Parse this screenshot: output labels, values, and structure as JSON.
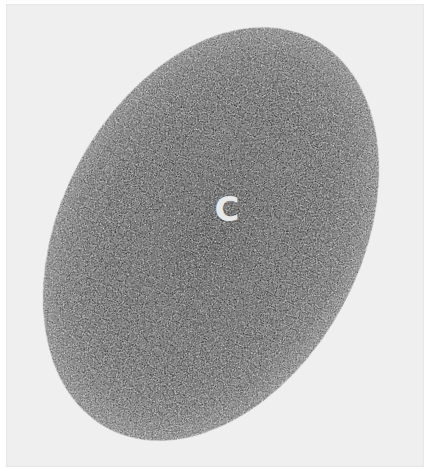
{
  "figure": {
    "label": "C",
    "background_color": "#efefef",
    "blob_color": "#0a0a0a",
    "label_color": "#e8e8e8"
  }
}
